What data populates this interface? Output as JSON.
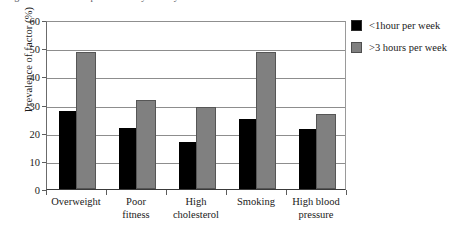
{
  "caption_remnant": "Figure — risk factor prevalence by activity",
  "chart_data": {
    "type": "bar",
    "title": "",
    "xlabel": "",
    "ylabel": "Prevalence of factor (%)",
    "categories": [
      "Overweight",
      "Poor fitness",
      "High cholesterol",
      "Smoking",
      "High blood pressure"
    ],
    "category_lines": [
      [
        "Overweight"
      ],
      [
        "Poor",
        "fitness"
      ],
      [
        "High",
        "cholesterol"
      ],
      [
        "Smoking"
      ],
      [
        "High blood",
        "pressure"
      ]
    ],
    "series": [
      {
        "name": "<1hour per week",
        "color": "#000000",
        "values": [
          27,
          21,
          16,
          24,
          20.5
        ]
      },
      {
        "name": ">3 hours per week",
        "color": "#808080",
        "values": [
          48,
          31,
          28.5,
          48,
          26
        ]
      }
    ],
    "ylim": [
      0,
      60
    ],
    "yticks": [
      0,
      10,
      20,
      30,
      40,
      50,
      60
    ],
    "ytick_labels": [
      "0",
      "10",
      "20",
      "30",
      "40",
      "50",
      "60"
    ],
    "grid": true,
    "legend_position": "right"
  }
}
